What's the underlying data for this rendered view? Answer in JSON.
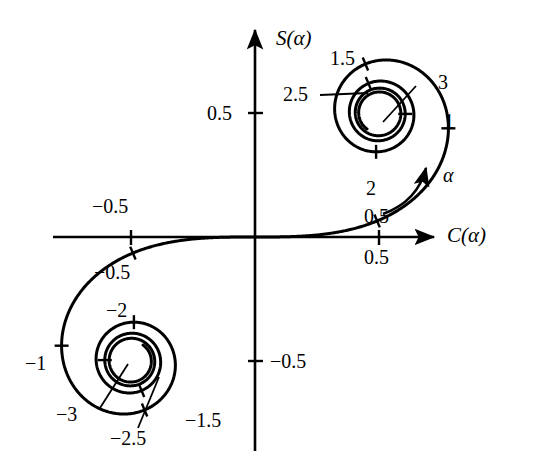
{
  "figure": {
    "name": "cornu-spiral",
    "background": "#ffffff",
    "ink": "#000000",
    "width": 535,
    "height": 465
  },
  "axes": {
    "x_label": "C(α)",
    "y_label": "S(α)",
    "origin_px": [
      255,
      237
    ],
    "scale_px_per_unit": 248,
    "x_ticks": [
      {
        "value": -0.5,
        "label": "−0.5"
      },
      {
        "value": 0.5,
        "label": "0.5"
      }
    ],
    "y_ticks": [
      {
        "value": 0.5,
        "label": "0.5"
      },
      {
        "value": -0.5,
        "label": "−0.5"
      }
    ],
    "arrow_heads": [
      "x-positive",
      "y-positive"
    ]
  },
  "annotation": {
    "direction_arrow_label": "α",
    "direction_arrow_name": "alpha-direction-arrow"
  },
  "labels": {
    "y_tick_pos_half": "0.5",
    "y_tick_neg_half": "−0.5",
    "x_tick_pos_half": "0.5",
    "x_tick_neg_half": "−0.5",
    "p_0_5": "0.5",
    "p_1": "1",
    "p_1_5": "1.5",
    "p_2": "2",
    "p_2_5": "2.5",
    "p_3": "3",
    "p_n0_5": "−0.5",
    "p_n1": "−1",
    "p_n1_5": "−1.5",
    "p_n2": "−2",
    "p_n2_5": "−2.5",
    "p_n3": "−3",
    "alpha": "α",
    "x_axis": "C(α)",
    "y_axis": "S(α)"
  },
  "chart_data": {
    "type": "line",
    "title": "",
    "subtitle": "",
    "xlabel": "C(α)",
    "ylabel": "S(α)",
    "xlim": [
      -0.82,
      0.75
    ],
    "ylim": [
      -0.85,
      0.85
    ],
    "grid": false,
    "legend": null,
    "curve_name": "Cornu spiral (Euler spiral) of Fresnel integrals",
    "parametric": {
      "parameter": "α",
      "parameter_range": [
        -4.0,
        4.0
      ],
      "x_formula": "C(α) = ∫₀^α cos(π t² / 2) dt",
      "y_formula": "S(α) = ∫₀^α sin(π t² / 2) dt",
      "asymptote_upper": [
        0.5,
        0.5
      ],
      "asymptote_lower": [
        -0.5,
        -0.5
      ]
    },
    "marked_points": [
      {
        "alpha": 0.5,
        "C": 0.4923,
        "S": 0.0647,
        "label": "0.5"
      },
      {
        "alpha": 1.0,
        "C": 0.7799,
        "S": 0.4383,
        "label": "1"
      },
      {
        "alpha": 1.5,
        "C": 0.4453,
        "S": 0.6975,
        "label": "1.5"
      },
      {
        "alpha": 2.0,
        "C": 0.4883,
        "S": 0.3434,
        "label": "2"
      },
      {
        "alpha": 2.5,
        "C": 0.4574,
        "S": 0.6192,
        "label": "2.5"
      },
      {
        "alpha": 3.0,
        "C": 0.6057,
        "S": 0.4963,
        "label": "3"
      },
      {
        "alpha": -0.5,
        "C": -0.4923,
        "S": -0.0647,
        "label": "−0.5"
      },
      {
        "alpha": -1.0,
        "C": -0.7799,
        "S": -0.4383,
        "label": "−1"
      },
      {
        "alpha": -1.5,
        "C": -0.4453,
        "S": -0.6975,
        "label": "−1.5"
      },
      {
        "alpha": -2.0,
        "C": -0.4883,
        "S": -0.3434,
        "label": "−2"
      },
      {
        "alpha": -2.5,
        "C": -0.4574,
        "S": -0.6192,
        "label": "−2.5"
      },
      {
        "alpha": -3.0,
        "C": -0.6057,
        "S": -0.4963,
        "label": "−3"
      }
    ]
  }
}
